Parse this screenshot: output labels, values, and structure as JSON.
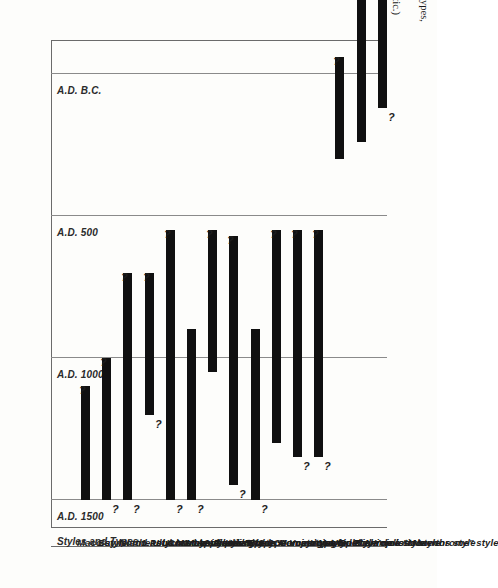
{
  "figure": {
    "number": "Figure 15.",
    "caption_line1": "—Temporal relationship of ceramic styles and types, Northeast Coast",
    "caption_line2": "and Ulua-Yojoa regions, Honduras.  (Tentative and diagrammatic.)",
    "caption_full": "Figure 15.—Temporal relationship of ceramic styles and types, Northeast Coast and Ulua-Yojoa regions, Honduras. (Tentative and diagrammatic.)"
  },
  "axis": {
    "column_header": "Styles and Types",
    "ticks": [
      "A.D. 1500",
      "A.D. 1000",
      "A.D. 500",
      "A.D. B.C."
    ],
    "uncertain_marker": "?"
  },
  "chart_data": {
    "type": "bar",
    "title": "Temporal relationship of ceramic styles and types, Northeast Coast and Ulua-Yojoa regions, Honduras",
    "orientation": "horizontal-rotated",
    "xlabel": "Styles and Types",
    "ylabel": "",
    "grid": true,
    "legend": "none",
    "axis_ticks": [
      "A.D. 1500",
      "A.D. 1000",
      "A.D. 500",
      "A.D. B.C."
    ],
    "axis_tick_years": [
      1500,
      1000,
      500,
      0
    ],
    "ylim": [
      1600,
      -120
    ],
    "note": "Each bar spans the estimated date range of a ceramic style or type; '?' marks an uncertain terminus.",
    "categories": [
      "Maco style",
      "Bay Island Polychrome style",
      "Northeast Coast Appliqué style",
      "1. Ulua Marble Vase-like type",
      "Ulua Mayoid style",
      "1. Las Flores type",
      "2. Santa Rita type",
      "Ulua Bold Geometric style",
      "1. San Marcos type",
      "2. Comayagua type",
      "Yojoa Mayoid style",
      "Yojoa Bold Animalistic style",
      "Ulua Bichrome style",
      "Playa de los Muertos style",
      "Yojoa \"Monochrome\" style"
    ],
    "ranges": [
      {
        "label": "Maco style",
        "start": 1500,
        "end": 1100,
        "start_q": false,
        "end_q": true
      },
      {
        "label": "Bay Island Polychrome style",
        "start": 1500,
        "end": 1000,
        "start_q": true,
        "end_q": true
      },
      {
        "label": "Northeast Coast Appliqué style",
        "start": 1500,
        "end": 700,
        "start_q": true,
        "end_q": true
      },
      {
        "label": "1. Ulua Marble Vase-like type",
        "start": 1200,
        "end": 700,
        "start_q": true,
        "end_q": true
      },
      {
        "label": "Ulua Mayoid style",
        "start": 1500,
        "end": 550,
        "start_q": true,
        "end_q": true
      },
      {
        "label": "1. Las Flores type",
        "start": 1500,
        "end": 900,
        "start_q": true,
        "end_q": false
      },
      {
        "label": "2. Santa Rita type",
        "start": 1050,
        "end": 550,
        "start_q": false,
        "end_q": true
      },
      {
        "label": "Ulua Bold Geometric style",
        "start": 1450,
        "end": 570,
        "start_q": true,
        "end_q": true
      },
      {
        "label": "1. San Marcos type",
        "start": 1500,
        "end": 900,
        "start_q": true,
        "end_q": false
      },
      {
        "label": "2. Comayagua type",
        "start": 1300,
        "end": 550,
        "start_q": false,
        "end_q": true
      },
      {
        "label": "Yojoa Mayoid style",
        "start": 1350,
        "end": 550,
        "start_q": true,
        "end_q": true
      },
      {
        "label": "Yojoa Bold Animalistic style",
        "start": 1350,
        "end": 550,
        "start_q": true,
        "end_q": true
      },
      {
        "label": "Ulua Bichrome style",
        "start": 300,
        "end": -60,
        "start_q": false,
        "end_q": true
      },
      {
        "label": "Playa de los Muertos style",
        "start": 240,
        "end": -430,
        "start_q": false,
        "end_q": false
      },
      {
        "label": "Yojoa \"Monochrome\" style",
        "start": 120,
        "end": -540,
        "start_q": true,
        "end_q": true
      }
    ]
  }
}
